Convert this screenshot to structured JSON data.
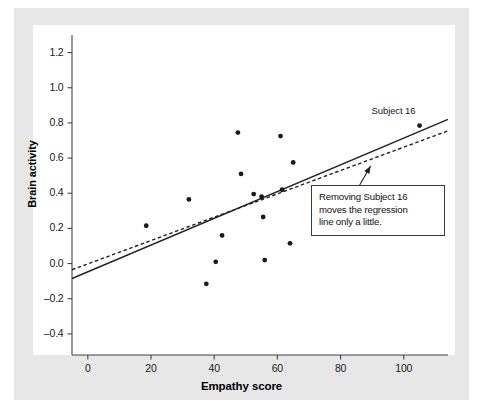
{
  "figure": {
    "background_color": "#e7e7e7",
    "plot_background_color": "#ffffff",
    "axis_color": "#444444",
    "point_color": "#1a1a1a",
    "line_color": "#222222"
  },
  "annotations": {
    "point_label": "Subject 16",
    "callout_lines": [
      "Removing Subject 16",
      "moves the regression",
      "line only a little."
    ]
  },
  "chart_data": {
    "type": "scatter",
    "title": "",
    "xlabel": "Empathy score",
    "ylabel": "Brain activity",
    "xlim": [
      -5,
      114
    ],
    "ylim": [
      -0.52,
      1.3
    ],
    "xticks": [
      0,
      20,
      40,
      60,
      80,
      100
    ],
    "xticklabels": [
      "0",
      "20",
      "40",
      "60",
      "80",
      "100"
    ],
    "yticks": [
      1.2,
      1.0,
      0.8,
      0.6,
      0.4,
      0.2,
      0.0,
      -0.2,
      -0.4
    ],
    "yticklabels": [
      "1.2",
      "1.0",
      "0.8",
      "0.6",
      "0.4",
      "0.2",
      "0.0",
      "–0.2",
      "–0.4"
    ],
    "grid": false,
    "legend": false,
    "points": [
      {
        "x": 18.5,
        "y": 0.215,
        "label": ""
      },
      {
        "x": 32.0,
        "y": 0.365,
        "label": ""
      },
      {
        "x": 37.5,
        "y": -0.115,
        "label": ""
      },
      {
        "x": 40.5,
        "y": 0.01,
        "label": ""
      },
      {
        "x": 42.5,
        "y": 0.16,
        "label": ""
      },
      {
        "x": 47.5,
        "y": 0.745,
        "label": ""
      },
      {
        "x": 48.5,
        "y": 0.51,
        "label": ""
      },
      {
        "x": 52.5,
        "y": 0.395,
        "label": ""
      },
      {
        "x": 55.0,
        "y": 0.38,
        "label": ""
      },
      {
        "x": 55.5,
        "y": 0.265,
        "label": ""
      },
      {
        "x": 56.0,
        "y": 0.02,
        "label": ""
      },
      {
        "x": 61.0,
        "y": 0.725,
        "label": ""
      },
      {
        "x": 61.5,
        "y": 0.42,
        "label": ""
      },
      {
        "x": 64.0,
        "y": 0.115,
        "label": ""
      },
      {
        "x": 65.0,
        "y": 0.575,
        "label": ""
      },
      {
        "x": 105.0,
        "y": 0.785,
        "label": "Subject 16"
      }
    ],
    "lines": [
      {
        "name": "regression-all-subjects",
        "style": "solid",
        "x1": -5,
        "y1": -0.085,
        "x2": 114,
        "y2": 0.82
      },
      {
        "name": "regression-without-subject-16",
        "style": "dashed",
        "x1": -5,
        "y1": -0.035,
        "x2": 114,
        "y2": 0.755
      }
    ],
    "leader_line": {
      "name": "callout-leader",
      "from_x": 89.5,
      "from_y": 0.555,
      "to_x": 79.0,
      "to_y": 0.225
    }
  }
}
